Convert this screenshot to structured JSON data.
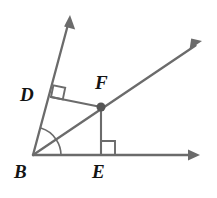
{
  "figure": {
    "type": "geometry-diagram",
    "background_color": "#ffffff",
    "stroke_color": "#6b6b6b",
    "label_color": "#141414",
    "points": {
      "B": {
        "label": "B",
        "x": 33,
        "y": 155,
        "role": "angle-vertex"
      },
      "D": {
        "label": "D",
        "x": 51,
        "y": 97,
        "role": "foot-of-perpendicular-on-upper-ray"
      },
      "E": {
        "label": "E",
        "x": 101,
        "y": 155,
        "role": "foot-of-perpendicular-on-horizontal-ray"
      },
      "F": {
        "label": "F",
        "x": 101,
        "y": 107,
        "role": "point-on-bisector"
      }
    },
    "rays": [
      {
        "name": "ray-B-upper",
        "from": "B",
        "tip_x": 70,
        "tip_y": 15,
        "arrow": true
      },
      {
        "name": "ray-B-bisector",
        "from": "B",
        "tip_x": 202,
        "tip_y": 41,
        "arrow": true
      },
      {
        "name": "ray-B-horizontal",
        "from": "B",
        "tip_x": 200,
        "tip_y": 155,
        "arrow": true
      }
    ],
    "segments": [
      {
        "name": "segment-D-F",
        "from": "D",
        "to": "F"
      },
      {
        "name": "segment-F-E",
        "from": "F",
        "to": "E"
      }
    ],
    "right_angle_marks": [
      {
        "name": "right-angle-at-D",
        "at": "D",
        "size": 12
      },
      {
        "name": "right-angle-at-E",
        "at": "E",
        "size": 14
      }
    ],
    "angle_arcs": [
      {
        "name": "angle-arc-upper",
        "at": "B",
        "radius": 28,
        "between": [
          "ray-B-upper",
          "ray-B-bisector"
        ]
      },
      {
        "name": "angle-arc-lower",
        "at": "B",
        "radius": 28,
        "between": [
          "ray-B-bisector",
          "ray-B-horizontal"
        ]
      }
    ],
    "markers": [
      {
        "name": "point-dot-F",
        "at": "F",
        "radius": 4.5,
        "filled": true
      }
    ]
  }
}
